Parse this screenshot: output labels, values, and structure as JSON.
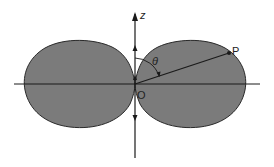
{
  "diagram": {
    "type": "polar dipole radiation pattern (two-lobe figure-eight)",
    "colors": {
      "lobe_fill": "#7b7b7b",
      "lobe_stroke": "#2a2a2a",
      "axis": "#1a1a1a",
      "background": "#ffffff"
    },
    "labels": {
      "z_axis": "z",
      "origin": "O",
      "point": "P",
      "angle": "θ"
    },
    "elements": {
      "z_axis": {
        "x": 135,
        "y_top": 12,
        "y_bottom": 158
      },
      "horizontal_axis": {
        "y": 84,
        "x_left": 14,
        "x_right": 260
      },
      "origin": {
        "x": 135,
        "y": 84
      },
      "point_P": {
        "x": 229,
        "y": 53
      },
      "left_lobe": {
        "x_min": 24,
        "x_max": 135,
        "y_min": 41,
        "y_max": 128
      },
      "right_lobe": {
        "x_min": 135,
        "x_max": 245,
        "y_min": 40,
        "y_max": 127
      }
    }
  }
}
